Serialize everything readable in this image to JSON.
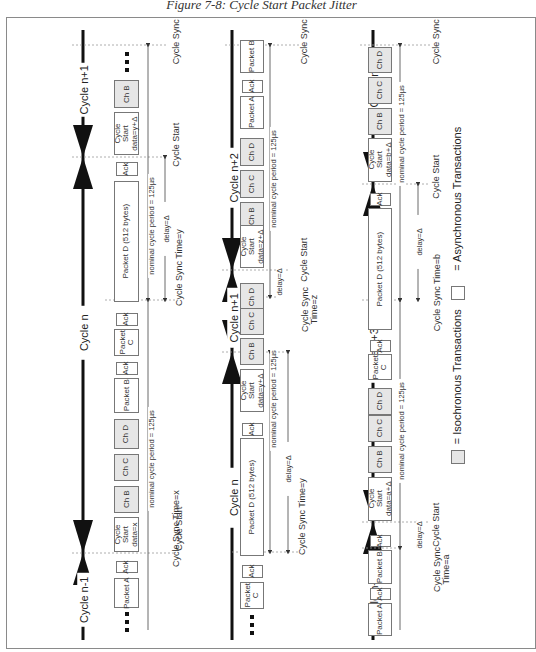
{
  "caption": "Figure 7-8: Cycle Start Packet Jitter",
  "legend": {
    "isochronous": "= Isochronous Transactions",
    "asynchronous": "= Asynchronous Transactions",
    "iso_color": "#e6e6e6",
    "async_color": "#ffffff"
  },
  "common": {
    "ack": "Ack",
    "period": "nominal cycle period = 125µs",
    "delay": "delay=Δ",
    "cycle_start": "Cycle Start",
    "cycle_sync": "Cycle Sync"
  },
  "rows": [
    {
      "cycles": [
        "Cycle n-1",
        "Cycle n",
        "Cycle n+1"
      ],
      "boxes": {
        "ch_b_top": "Ch B",
        "cs_top": "Cycle Start data=y+Δ",
        "packet_d": "Packet D (512 bytes)",
        "packet_c": "Packet C",
        "packet_b": "Packet B",
        "ch_d": "Ch D",
        "ch_c": "Ch C",
        "ch_b": "Ch B",
        "cs_bottom": "Cycle Start data=x",
        "packet_a": "Packet A"
      },
      "labels": {
        "sync_time_y": "Cycle Sync Time=y",
        "sync_time_x": "Cycle Sync Time=x",
        "cycle_start_bottom": "Cycle Start"
      }
    },
    {
      "cycles": [
        "Cycle n",
        "Cycle n+1",
        "Cycle n+2"
      ],
      "boxes": {
        "packet_b": "Packet B",
        "packet_a": "Packet A",
        "ch_d": "Ch D",
        "ch_c": "Ch C",
        "ch_b": "Ch B",
        "cs_top": "Cycle Start data=z+Δ",
        "ch_d2": "Ch D",
        "ch_c2": "Ch C",
        "ch_b2": "Ch B",
        "cs_mid": "Cycle Start data=y+Δ",
        "packet_d": "Packet D (512 bytes)",
        "packet_c": "Packet C"
      },
      "labels": {
        "sync_time_z": "Cycle Sync Time=z",
        "sync_time_y": "Cycle Sync Time=y",
        "cycle_start_mid": "Cycle Start"
      }
    },
    {
      "cycles": [
        "Cycle n+2",
        "Cycle n+3",
        "Cycle n+4"
      ],
      "boxes": {
        "ch_d": "Ch D",
        "ch_c": "Ch C",
        "ch_b": "Ch B",
        "cs_top": "Cycle Start data=b+Δ",
        "packet_d": "Packet D (512 bytes)",
        "packet_c": "Packet C",
        "ch_d2": "Ch D",
        "ch_c2": "Ch C",
        "ch_b2": "Ch B",
        "cs_bottom": "Cycle Start data=a+Δ",
        "packet_b": "Packet B",
        "packet_a": "Packet A"
      },
      "labels": {
        "sync_time_b": "Cycle Sync Time=b",
        "sync_time_a": "Cycle Sync Time=a"
      }
    }
  ]
}
